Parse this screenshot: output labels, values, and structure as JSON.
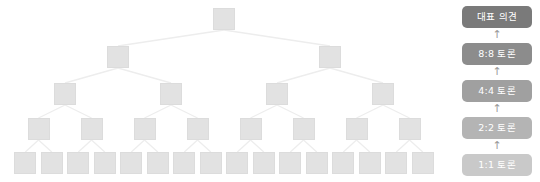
{
  "diagram": {
    "tree": {
      "node_color": "#e2e2e2",
      "node_border_color": "#dcdcdc",
      "edge_color": "#ededed",
      "levels": [
        {
          "name": "root",
          "count": 1,
          "y": 8,
          "stage": "대표 의견"
        },
        {
          "name": "level-8v8",
          "count": 2,
          "y": 46,
          "stage": "8:8 토론"
        },
        {
          "name": "level-4v4",
          "count": 4,
          "y": 83,
          "stage": "4:4 토론"
        },
        {
          "name": "level-2v2",
          "count": 8,
          "y": 118,
          "stage": "2:2 토론"
        },
        {
          "name": "level-1v1",
          "count": 16,
          "y": 152,
          "stage": "1:1 토론"
        }
      ],
      "node_width": 22,
      "node_height": 22
    }
  },
  "stages": {
    "arrow_glyph": "↑",
    "items": [
      {
        "label": "대표 의견",
        "color": "#7a7a7a",
        "y": 6
      },
      {
        "label": "8:8 토론",
        "color": "#8c8c8c",
        "y": 43
      },
      {
        "label": "4:4 토론",
        "color": "#a0a0a0",
        "y": 80
      },
      {
        "label": "2:2 토론",
        "color": "#b4b4b4",
        "y": 117
      },
      {
        "label": "1:1 토론",
        "color": "#c9c9c9",
        "y": 154
      }
    ],
    "arrows": [
      {
        "y": 28
      },
      {
        "y": 65
      },
      {
        "y": 102
      },
      {
        "y": 139
      }
    ]
  }
}
